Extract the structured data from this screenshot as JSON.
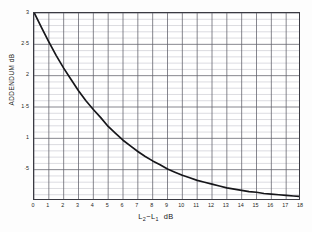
{
  "chart_data": {
    "type": "line",
    "title": "",
    "xlabel": "L2-L1 dB",
    "xlabel_parts": {
      "l1": "L",
      "sub1": "2",
      "minus": "−",
      "l2": "L",
      "sub2": "1",
      "unit": "dB"
    },
    "ylabel": "ADDENDUM dB",
    "xlim": [
      0,
      18
    ],
    "ylim": [
      0,
      3
    ],
    "xticks": [
      "0",
      "1",
      "2",
      "3",
      "4",
      "5",
      "6",
      "7",
      "8",
      "9",
      "10",
      "11",
      "12",
      "13",
      "14",
      "15",
      "16",
      "17",
      "18"
    ],
    "yticks": [
      "·5",
      "1",
      "1·5",
      "2",
      "2·5",
      "3"
    ],
    "ytick_values": [
      0.5,
      1.0,
      1.5,
      2.0,
      2.5,
      3.0
    ],
    "grid": "on",
    "grid_major_x_step": 1,
    "grid_major_y_step": 0.5,
    "grid_minor_y_step": 0.1,
    "legend": "none",
    "series": [
      {
        "name": "Decibel addition addendum",
        "color": "#16161a",
        "x": [
          0,
          0.5,
          1,
          1.5,
          2,
          2.5,
          3,
          3.5,
          4,
          4.5,
          5,
          5.5,
          6,
          6.5,
          7,
          7.5,
          8,
          8.5,
          9,
          9.5,
          10,
          10.5,
          11,
          11.5,
          12,
          12.5,
          13,
          13.5,
          14,
          14.5,
          15,
          15.5,
          16,
          16.5,
          17,
          17.5,
          18
        ],
        "values": [
          3.01,
          2.77,
          2.54,
          2.32,
          2.12,
          1.94,
          1.76,
          1.6,
          1.46,
          1.33,
          1.19,
          1.08,
          0.97,
          0.88,
          0.79,
          0.71,
          0.64,
          0.58,
          0.51,
          0.46,
          0.41,
          0.37,
          0.33,
          0.3,
          0.27,
          0.24,
          0.21,
          0.19,
          0.17,
          0.15,
          0.14,
          0.12,
          0.11,
          0.1,
          0.09,
          0.08,
          0.07
        ]
      }
    ]
  },
  "axes_geometry": {
    "plot_left_px": 33,
    "plot_top_px": 12,
    "plot_width_px": 267,
    "plot_height_px": 188
  }
}
